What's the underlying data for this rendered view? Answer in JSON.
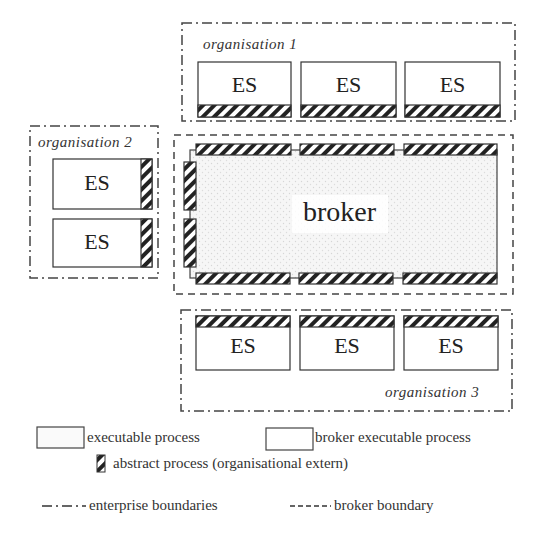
{
  "diagram": {
    "organisations": [
      {
        "id": "org1",
        "label": "organisation 1",
        "processes": [
          "ES",
          "ES",
          "ES"
        ],
        "abstract_side": "bottom"
      },
      {
        "id": "org2",
        "label": "organisation 2",
        "processes": [
          "ES",
          "ES"
        ],
        "abstract_side": "right"
      },
      {
        "id": "org3",
        "label": "organisation 3",
        "processes": [
          "ES",
          "ES",
          "ES"
        ],
        "abstract_side": "top"
      }
    ],
    "broker": {
      "label": "broker"
    }
  },
  "legend": {
    "executable_process": "executable process",
    "broker_executable_process": "broker executable process",
    "abstract_process": "abstract process (organisational extern)",
    "enterprise_boundaries": "enterprise boundaries",
    "broker_boundary": "broker boundary"
  },
  "colors": {
    "line": "#333333",
    "hatch": "#222222",
    "broker_fill": "#f2f2f2",
    "boundary": "#444444"
  }
}
